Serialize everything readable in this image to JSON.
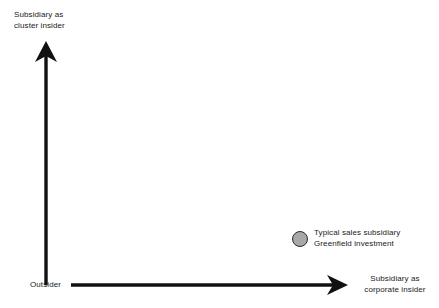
{
  "diagram": {
    "type": "conceptual-positioning-plot",
    "background_color": "#ffffff",
    "axis_color": "#111111",
    "text_color": "#1a1a1a",
    "y_axis": {
      "top_label": "Subsidiary as\ncluster insider",
      "origin_label": "Outsider",
      "direction": "up",
      "arrow": "arrow-up-icon"
    },
    "x_axis": {
      "right_label": "Subsidiary as\ncorporate insider",
      "origin_label": "Outsider",
      "direction": "right",
      "arrow": "arrow-right-icon"
    },
    "points": [
      {
        "label": "Typical sales subsidiary\nGreenfield investment",
        "marker": "filled-circle-marker",
        "fill_color": "#a8a8a8",
        "stroke_color": "#2b2b2b",
        "x_position": "high",
        "y_position": "low"
      }
    ]
  }
}
